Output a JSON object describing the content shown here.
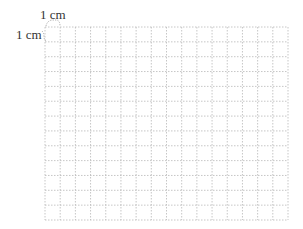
{
  "diagram": {
    "type": "grid-paper",
    "labels": {
      "top": "1 cm",
      "left": "1 cm"
    },
    "grid": {
      "columns": 16,
      "rows": 13,
      "cell_size_label": "1 cm",
      "line_style": "dotted",
      "line_color": "#b8b8b8",
      "origin_x": 45,
      "origin_y": 27,
      "width": 243,
      "height": 193
    },
    "colors": {
      "text": "#333333",
      "bracket": "#999999",
      "background": "#ffffff"
    }
  }
}
